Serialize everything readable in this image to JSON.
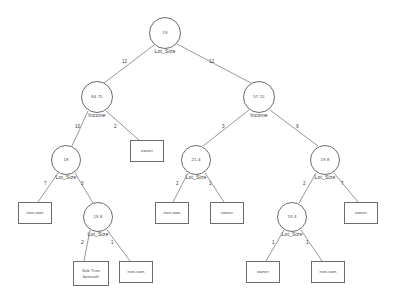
{
  "diagram": {
    "type": "decision-tree",
    "title": "",
    "node_shape_internal": "circle",
    "node_shape_leaf": "rectangle",
    "colors": {
      "stroke": "#6b6b70",
      "text": "#4a4a4f",
      "background": "#ffffff"
    },
    "nodes": [
      {
        "id": "n0",
        "kind": "internal",
        "value": "19",
        "split": "Lot_Size",
        "cx": 165,
        "cy": 33,
        "r": 16
      },
      {
        "id": "n1",
        "kind": "internal",
        "value": "84.75",
        "split": "Income",
        "cx": 97,
        "cy": 97,
        "r": 16
      },
      {
        "id": "n2",
        "kind": "internal",
        "value": "57.15",
        "split": "Income",
        "cx": 259,
        "cy": 97,
        "r": 16
      },
      {
        "id": "n3",
        "kind": "internal",
        "value": "18",
        "split": "Lot_Size",
        "cx": 66,
        "cy": 160,
        "r": 15
      },
      {
        "id": "n4",
        "kind": "internal",
        "value": "19.8",
        "split": "Lot_Size",
        "cx": 98,
        "cy": 217,
        "r": 15
      },
      {
        "id": "n5",
        "kind": "internal",
        "value": "21.4",
        "split": "Lot_Size",
        "cx": 196,
        "cy": 160,
        "r": 15
      },
      {
        "id": "n6",
        "kind": "internal",
        "value": "19.8",
        "split": "Lot_Size",
        "cx": 325,
        "cy": 160,
        "r": 15
      },
      {
        "id": "n7",
        "kind": "internal",
        "value": "19.4",
        "split": "Lot_Size",
        "cx": 292,
        "cy": 217,
        "r": 15
      }
    ],
    "leaves": [
      {
        "id": "L1",
        "label": "owner",
        "x": 130,
        "y": 140,
        "w": 34,
        "h": 22
      },
      {
        "id": "L2",
        "label": "non-own",
        "x": 18,
        "y": 202,
        "w": 34,
        "h": 22
      },
      {
        "id": "L3",
        "label": "Sub Tree\nbeneath",
        "x": 73,
        "y": 261,
        "w": 36,
        "h": 25
      },
      {
        "id": "L4",
        "label": "non-own",
        "x": 119,
        "y": 261,
        "w": 34,
        "h": 22
      },
      {
        "id": "L5",
        "label": "non-own",
        "x": 155,
        "y": 202,
        "w": 34,
        "h": 22
      },
      {
        "id": "L6",
        "label": "owner",
        "x": 210,
        "y": 202,
        "w": 34,
        "h": 22
      },
      {
        "id": "L7",
        "label": "owner",
        "x": 344,
        "y": 202,
        "w": 34,
        "h": 22
      },
      {
        "id": "L8",
        "label": "owner",
        "x": 246,
        "y": 261,
        "w": 34,
        "h": 22
      },
      {
        "id": "L9",
        "label": "non-own",
        "x": 311,
        "y": 261,
        "w": 34,
        "h": 22
      }
    ],
    "edges": [
      {
        "from": "n0",
        "to": "n1",
        "label": "12",
        "x1": 154,
        "y1": 45,
        "x2": 104,
        "y2": 83,
        "lx": 122,
        "ly": 62
      },
      {
        "from": "n0",
        "to": "n2",
        "label": "12",
        "x1": 177,
        "y1": 44,
        "x2": 251,
        "y2": 83,
        "lx": 209,
        "ly": 62
      },
      {
        "from": "n1",
        "to": "n3",
        "label": "10",
        "x1": 88,
        "y1": 111,
        "x2": 72,
        "y2": 146,
        "lx": 75,
        "ly": 127
      },
      {
        "from": "n1",
        "to": "L1",
        "label": "2",
        "x1": 106,
        "y1": 111,
        "x2": 139,
        "y2": 140,
        "lx": 114,
        "ly": 127
      },
      {
        "from": "n3",
        "to": "L2",
        "label": "7",
        "x1": 58,
        "y1": 173,
        "x2": 38,
        "y2": 202,
        "lx": 44,
        "ly": 184
      },
      {
        "from": "n3",
        "to": "n4",
        "label": "3",
        "x1": 75,
        "y1": 173,
        "x2": 93,
        "y2": 203,
        "lx": 81,
        "ly": 184
      },
      {
        "from": "n4",
        "to": "L3",
        "label": "2",
        "x1": 90,
        "y1": 230,
        "x2": 84,
        "y2": 261,
        "lx": 81,
        "ly": 243
      },
      {
        "from": "n4",
        "to": "L4",
        "label": "1",
        "x1": 107,
        "y1": 230,
        "x2": 130,
        "y2": 261,
        "lx": 111,
        "ly": 243
      },
      {
        "from": "n2",
        "to": "n5",
        "label": "3",
        "x1": 249,
        "y1": 110,
        "x2": 203,
        "y2": 146,
        "lx": 222,
        "ly": 127
      },
      {
        "from": "n2",
        "to": "n6",
        "label": "9",
        "x1": 270,
        "y1": 110,
        "x2": 318,
        "y2": 146,
        "lx": 296,
        "ly": 127
      },
      {
        "from": "n5",
        "to": "L5",
        "label": "2",
        "x1": 188,
        "y1": 173,
        "x2": 173,
        "y2": 202,
        "lx": 176,
        "ly": 184
      },
      {
        "from": "n5",
        "to": "L6",
        "label": "1",
        "x1": 205,
        "y1": 173,
        "x2": 224,
        "y2": 202,
        "lx": 209,
        "ly": 184
      },
      {
        "from": "n6",
        "to": "n7",
        "label": "2",
        "x1": 316,
        "y1": 173,
        "x2": 299,
        "y2": 203,
        "lx": 303,
        "ly": 184
      },
      {
        "from": "n6",
        "to": "L7",
        "label": "7",
        "x1": 334,
        "y1": 173,
        "x2": 358,
        "y2": 202,
        "lx": 341,
        "ly": 184
      },
      {
        "from": "n7",
        "to": "L8",
        "label": "1",
        "x1": 284,
        "y1": 230,
        "x2": 266,
        "y2": 261,
        "lx": 272,
        "ly": 243
      },
      {
        "from": "n7",
        "to": "L9",
        "label": "1",
        "x1": 301,
        "y1": 230,
        "x2": 322,
        "y2": 261,
        "lx": 306,
        "ly": 243
      }
    ]
  }
}
